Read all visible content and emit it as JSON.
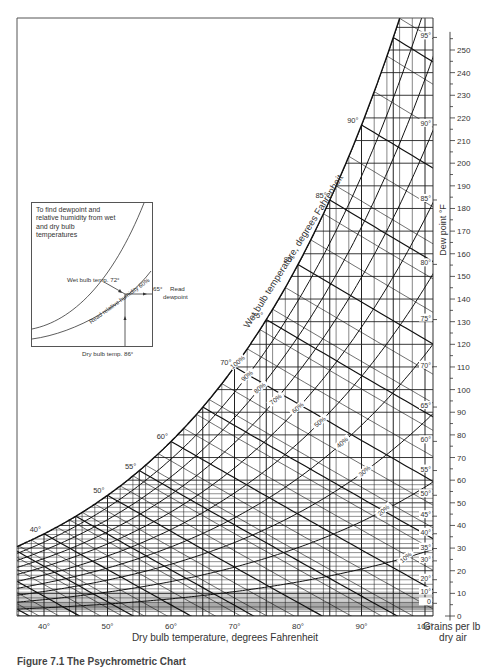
{
  "chart_data": {
    "type": "psychrometric",
    "title": "Psychrometric Chart",
    "xlabel": "Dry bulb temperature, degrees Fahrenheit",
    "ylabel_right": "Grains per lb dry air",
    "dewpoint_axis_label": "Dew point °F",
    "wetbulb_axis_label": "Wet bulb temperature, degrees Fahrenheit",
    "x_ticks": [
      40,
      50,
      60,
      70,
      80,
      90,
      100
    ],
    "x_tick_labels": [
      "40°",
      "50°",
      "60°",
      "70°",
      "80°",
      "90°",
      "100°"
    ],
    "xlim": [
      36.4,
      101.3
    ],
    "grains_ticks": [
      0,
      10,
      20,
      30,
      40,
      50,
      60,
      70,
      80,
      90,
      100,
      110,
      120,
      130,
      140,
      150,
      160,
      170,
      180,
      190,
      200,
      210,
      220,
      230,
      240,
      250
    ],
    "ylim_grains": [
      0,
      258
    ],
    "dewpoint_ticks": [
      0,
      10,
      20,
      30,
      35,
      40,
      45,
      50,
      55,
      60,
      65,
      70,
      75,
      80,
      85,
      90,
      95
    ],
    "dewpoint_tick_labels": [
      "0",
      "10°",
      "20°",
      "30°",
      "35°",
      "40°",
      "45°",
      "50°",
      "55°",
      "60°",
      "65°",
      "70°",
      "75°",
      "80°",
      "85°",
      "90°",
      "95°"
    ],
    "wet_bulb_labels": [
      40,
      50,
      55,
      60,
      70,
      75,
      80,
      85,
      90
    ],
    "wet_bulb_label_text": [
      "40°",
      "50°",
      "55°",
      "60°",
      "70°",
      "75°",
      "80°",
      "85°",
      "90°"
    ],
    "relative_humidity_curves": [
      100,
      90,
      80,
      70,
      60,
      50,
      40,
      30,
      20,
      10
    ],
    "relative_humidity_labels": [
      "100%",
      "90%",
      "80%",
      "70%",
      "60%",
      "50%",
      "40%",
      "30%",
      "20%",
      "10%"
    ],
    "grid": true,
    "legend": null
  },
  "inset": {
    "title": "To find dewpoint and relative humidity from wet and dry bulb temperatures",
    "wet_bulb_label": "Wet bulb temp. 72°",
    "rh_label": "Read relative humidity 60%",
    "dewpoint_value": "65°",
    "dewpoint_label_1": "Read",
    "dewpoint_label_2": "dewpoint",
    "dry_bulb_label": "Dry bulb temp. 86°"
  },
  "caption": "Figure 7.1  The Psychrometric Chart"
}
